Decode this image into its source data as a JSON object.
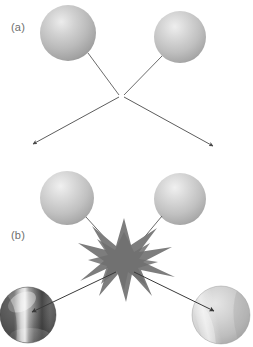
{
  "figure": {
    "width": 253,
    "height": 347,
    "background": "#ffffff",
    "caption_a": "(a)",
    "caption_b": "(b)"
  },
  "panels": [
    {
      "id": "panel-a",
      "label": "(a)",
      "label_x": 11,
      "label_y": 31,
      "kind": "elastic-scattering"
    },
    {
      "id": "panel-b",
      "label": "(b)",
      "label_x": 11,
      "label_y": 239,
      "kind": "inelastic-collision-with-burst"
    }
  ],
  "spheres": [
    {
      "name": "panel-a-incoming-sphere-left",
      "panel": "panel-a",
      "cx": 68,
      "cy": 33,
      "r": 28,
      "style": "plain-gray",
      "highlight_color": "#e6e6e6",
      "mid_color": "#b9b9b9",
      "edge_color": "#8f8f8f"
    },
    {
      "name": "panel-a-incoming-sphere-right",
      "panel": "panel-a",
      "cx": 180,
      "cy": 37,
      "r": 26,
      "style": "plain-gray",
      "highlight_color": "#e6e6e6",
      "mid_color": "#bcbcbc",
      "edge_color": "#939393"
    },
    {
      "name": "panel-b-incoming-sphere-left",
      "panel": "panel-b",
      "cx": 67,
      "cy": 198,
      "r": 27,
      "style": "plain-gray",
      "highlight_color": "#e8e8e8",
      "mid_color": "#bdbdbd",
      "edge_color": "#949494"
    },
    {
      "name": "panel-b-incoming-sphere-right",
      "panel": "panel-b",
      "cx": 180,
      "cy": 199,
      "r": 26,
      "style": "plain-gray",
      "highlight_color": "#e8e8e8",
      "mid_color": "#bdbdbd",
      "edge_color": "#949494"
    },
    {
      "name": "panel-b-product-sphere-dark",
      "panel": "panel-b",
      "cx": 28,
      "cy": 315,
      "r": 28,
      "style": "dark-streaked",
      "highlight_color": "#e2e2e2",
      "mid_color": "#7b7b7b",
      "edge_color": "#3d3d3d"
    },
    {
      "name": "panel-b-product-sphere-light",
      "panel": "panel-b",
      "cx": 221,
      "cy": 315,
      "r": 29,
      "style": "light-streaked",
      "highlight_color": "#efefef",
      "mid_color": "#c3c3c3",
      "edge_color": "#9b9b9b"
    }
  ],
  "burst": {
    "name": "collision-burst",
    "panel": "panel-b",
    "cx": 124,
    "cy": 260,
    "outer_radius": 38,
    "inner_radius": 15,
    "points": 11,
    "color": "#7a7a7a"
  },
  "vertex_a": {
    "name": "panel-a-collision-vertex",
    "x": 121,
    "y": 96
  },
  "paths": [
    {
      "name": "panel-a-incoming-path-left",
      "panel": "panel-a",
      "kind": "line",
      "x1": 88,
      "y1": 53,
      "x2": 119,
      "y2": 95,
      "color": "#5a5a5a",
      "width": 0.9,
      "arrow": false
    },
    {
      "name": "panel-a-incoming-path-right",
      "panel": "panel-a",
      "kind": "line",
      "x1": 162,
      "y1": 56,
      "x2": 124,
      "y2": 95,
      "color": "#5a5a5a",
      "width": 0.9,
      "arrow": false
    },
    {
      "name": "panel-a-outgoing-arrow-left",
      "panel": "panel-a",
      "kind": "arrow",
      "x1": 119,
      "y1": 97,
      "x2": 32,
      "y2": 145,
      "color": "#4a4a4a",
      "width": 0.9,
      "arrow": true
    },
    {
      "name": "panel-a-outgoing-arrow-right",
      "panel": "panel-a",
      "kind": "arrow",
      "x1": 124,
      "y1": 97,
      "x2": 214,
      "y2": 147,
      "color": "#4a4a4a",
      "width": 0.9,
      "arrow": true
    },
    {
      "name": "panel-b-incoming-path-left",
      "panel": "panel-b",
      "kind": "line",
      "x1": 86,
      "y1": 217,
      "x2": 116,
      "y2": 250,
      "color": "#5a5a5a",
      "width": 0.9,
      "arrow": false
    },
    {
      "name": "panel-b-incoming-path-right",
      "panel": "panel-b",
      "kind": "line",
      "x1": 162,
      "y1": 216,
      "x2": 134,
      "y2": 251,
      "color": "#5a5a5a",
      "width": 0.9,
      "arrow": false
    },
    {
      "name": "panel-b-outgoing-arrow-left",
      "panel": "panel-b",
      "kind": "arrow",
      "x1": 116,
      "y1": 272,
      "x2": 31,
      "y2": 312,
      "color": "#3a3a3a",
      "width": 1.0,
      "arrow": true
    },
    {
      "name": "panel-b-outgoing-arrow-right",
      "panel": "panel-b",
      "kind": "arrow",
      "x1": 134,
      "y1": 272,
      "x2": 215,
      "y2": 311,
      "color": "#3a3a3a",
      "width": 1.0,
      "arrow": true
    }
  ]
}
